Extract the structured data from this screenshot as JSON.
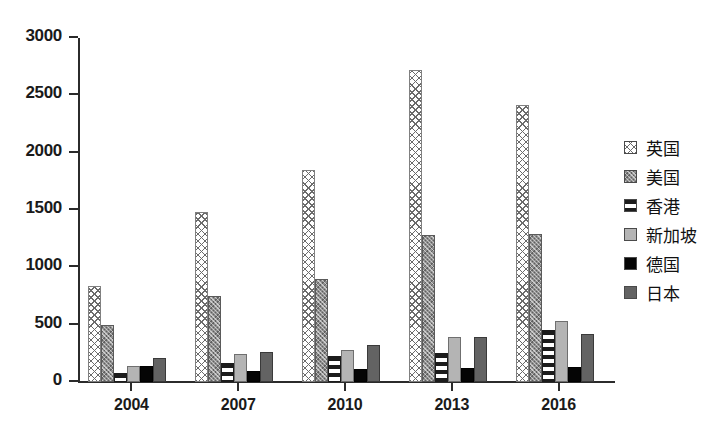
{
  "chart_data": {
    "type": "bar",
    "title": "",
    "subtitle": "",
    "xlabel": "",
    "ylabel": "",
    "categories": [
      "2004",
      "2007",
      "2010",
      "2013",
      "2016"
    ],
    "ylim": [
      0,
      3000
    ],
    "yticks": [
      0,
      500,
      1000,
      1500,
      2000,
      2500,
      3000
    ],
    "ytick_labels": [
      "0",
      "500",
      "1000",
      "1500",
      "2000",
      "2500",
      "3000"
    ],
    "grid": false,
    "legend_position": "right",
    "series": [
      {
        "name": "英国",
        "key": "uk",
        "pattern": "diagonal-cross-hatch",
        "values": [
          840,
          1480,
          1850,
          2720,
          2420
        ]
      },
      {
        "name": "美国",
        "key": "us",
        "pattern": "dense-dotted-grey",
        "values": [
          500,
          750,
          900,
          1280,
          1290
        ]
      },
      {
        "name": "香港",
        "key": "hk",
        "pattern": "horizontal-stripes",
        "values": [
          80,
          170,
          230,
          250,
          450
        ]
      },
      {
        "name": "新加坡",
        "key": "sg",
        "pattern": "solid-light-grey",
        "values": [
          140,
          240,
          280,
          390,
          530
        ]
      },
      {
        "name": "德国",
        "key": "de",
        "pattern": "solid-black",
        "values": [
          140,
          100,
          110,
          120,
          130
        ]
      },
      {
        "name": "日本",
        "key": "jp",
        "pattern": "solid-dark-grey",
        "values": [
          210,
          260,
          320,
          390,
          420
        ]
      }
    ],
    "colors": {
      "uk": "#ffffff",
      "us": "#8e8e8e",
      "hk": "#ffffff",
      "sg": "#b4b4b4",
      "de": "#050505",
      "jp": "#636363",
      "axis": "#2b2b2b",
      "text": "#1a1a1a",
      "background": "#ffffff"
    }
  }
}
